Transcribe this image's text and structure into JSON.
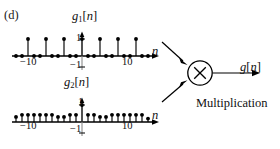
{
  "panel": {
    "label": "(d)"
  },
  "plots": [
    {
      "name": "g1",
      "title_main": "g",
      "title_sub": "1",
      "title_brk_open": "[",
      "title_var": "n",
      "title_brk_close": "]",
      "x_axis_label": "n",
      "x_tick_min": "−10",
      "x_tick_max": "10",
      "y_tick_pos": "1",
      "y_tick_neg": "−1",
      "axis_color": "#000000",
      "stem_color": "#000000"
    },
    {
      "name": "g2",
      "title_main": "g",
      "title_sub": "2",
      "title_brk_open": "[",
      "title_var": "n",
      "title_brk_close": "]",
      "x_axis_label": "n",
      "x_tick_min": "−10",
      "x_tick_max": "10",
      "y_tick_pos": "1",
      "y_tick_neg": "−1",
      "axis_color": "#000000",
      "stem_color": "#000000"
    }
  ],
  "diagram": {
    "operator_symbol": "×",
    "operation_label": "Multiplication",
    "output_main": "g",
    "output_brk_open": "[",
    "output_var": "n",
    "output_brk_close": "]",
    "line_color": "#000000"
  },
  "chart_data": [
    {
      "type": "stem",
      "title": "g1[n]",
      "xlabel": "n",
      "ylabel": "",
      "xlim": [
        -11,
        11
      ],
      "ylim": [
        -1,
        1
      ],
      "grid": false,
      "legend": "none",
      "x": [
        -11,
        -10,
        -9,
        -8,
        -7,
        -6,
        -5,
        -4,
        -3,
        -2,
        -1,
        0,
        1,
        2,
        3,
        4,
        5,
        6,
        7,
        8,
        9,
        10,
        11
      ],
      "y": [
        0,
        0,
        1,
        0,
        0,
        1,
        0,
        0,
        1,
        0,
        0,
        1,
        0,
        0,
        1,
        0,
        0,
        1,
        0,
        0,
        1,
        0,
        0
      ],
      "yticks": [
        -1,
        1
      ],
      "ytick_labels": [
        "−1",
        "1"
      ],
      "xticks": [
        -10,
        10
      ],
      "xtick_labels": [
        "−10",
        "10"
      ]
    },
    {
      "type": "stem",
      "title": "g2[n]",
      "xlabel": "n",
      "ylabel": "",
      "xlim": [
        -11,
        11
      ],
      "ylim": [
        -1,
        1
      ],
      "grid": false,
      "legend": "none",
      "x": [
        -11,
        -10,
        -9,
        -8,
        -7,
        -6,
        -5,
        -4,
        -3,
        -2,
        -1,
        0,
        1,
        2,
        3,
        4,
        5,
        6,
        7,
        8,
        9,
        10,
        11
      ],
      "y": [
        0.3,
        0.42,
        0.42,
        0.42,
        0.42,
        0.42,
        0.42,
        0.3,
        0.3,
        0.42,
        0.42,
        1.0,
        0.42,
        0.42,
        0.3,
        0.3,
        0.42,
        0.42,
        0.42,
        0.42,
        0.42,
        0.42,
        0.2
      ],
      "yticks": [
        -1,
        1
      ],
      "ytick_labels": [
        "−1",
        "1"
      ],
      "xticks": [
        -10,
        10
      ],
      "xtick_labels": [
        "−10",
        "10"
      ]
    }
  ]
}
